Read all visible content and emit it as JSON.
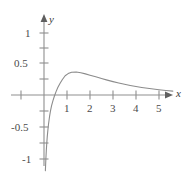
{
  "chart_data": {
    "type": "line",
    "title": "",
    "xlabel": "x",
    "ylabel": "y",
    "xlim": [
      -1.5,
      5.9
    ],
    "ylim": [
      -1.25,
      1.28
    ],
    "grid": false,
    "legend": null,
    "axis_names": {
      "x": "x",
      "y": "y"
    },
    "x_ticks": [
      {
        "value": -1,
        "label": ""
      },
      {
        "value": 1,
        "label": "1"
      },
      {
        "value": 2,
        "label": "2"
      },
      {
        "value": 3,
        "label": "3"
      },
      {
        "value": 4,
        "label": "4"
      },
      {
        "value": 5,
        "label": "5"
      }
    ],
    "y_ticks": [
      {
        "value": 1,
        "label": "1"
      },
      {
        "value": 0.75,
        "label": ""
      },
      {
        "value": 0.5,
        "label": "0.5"
      },
      {
        "value": 0.25,
        "label": ""
      },
      {
        "value": -0.25,
        "label": ""
      },
      {
        "value": -0.5,
        "label": "-0.5"
      },
      {
        "value": -0.75,
        "label": ""
      },
      {
        "value": -1,
        "label": "-1"
      }
    ],
    "series": [
      {
        "name": "curve",
        "color": "#8c8c8c",
        "points": [
          [
            0.06,
            -1.22
          ],
          [
            0.08,
            -1.04
          ],
          [
            0.1,
            -0.9
          ],
          [
            0.12,
            -0.78
          ],
          [
            0.14,
            -0.68
          ],
          [
            0.17,
            -0.56
          ],
          [
            0.2,
            -0.46
          ],
          [
            0.24,
            -0.35
          ],
          [
            0.28,
            -0.26
          ],
          [
            0.33,
            -0.17
          ],
          [
            0.39,
            -0.09
          ],
          [
            0.45,
            -0.02
          ],
          [
            0.52,
            0.05
          ],
          [
            0.6,
            0.12
          ],
          [
            0.7,
            0.19
          ],
          [
            0.8,
            0.25
          ],
          [
            0.92,
            0.31
          ],
          [
            1.05,
            0.345
          ],
          [
            1.2,
            0.368
          ],
          [
            1.4,
            0.372
          ],
          [
            1.6,
            0.36
          ],
          [
            1.8,
            0.341
          ],
          [
            2.0,
            0.32
          ],
          [
            2.25,
            0.293
          ],
          [
            2.5,
            0.266
          ],
          [
            2.75,
            0.24
          ],
          [
            3.0,
            0.216
          ],
          [
            3.25,
            0.194
          ],
          [
            3.5,
            0.173
          ],
          [
            3.75,
            0.154
          ],
          [
            4.0,
            0.137
          ],
          [
            4.25,
            0.122
          ],
          [
            4.5,
            0.108
          ],
          [
            4.75,
            0.096
          ],
          [
            5.0,
            0.085
          ],
          [
            5.3,
            0.073
          ],
          [
            5.6,
            0.063
          ]
        ]
      }
    ],
    "axis_color": "#8f8f8f",
    "curve_color": "#8c8c8c",
    "label_color": "#4a4a4a"
  },
  "labels": {
    "y_1": "1",
    "y_05": "0.5",
    "y_neg05": "-0.5",
    "y_neg1": "-1",
    "x_1": "1",
    "x_2": "2",
    "x_3": "3",
    "x_4": "4",
    "x_5": "5",
    "axis_x": "x",
    "axis_y": "y"
  }
}
